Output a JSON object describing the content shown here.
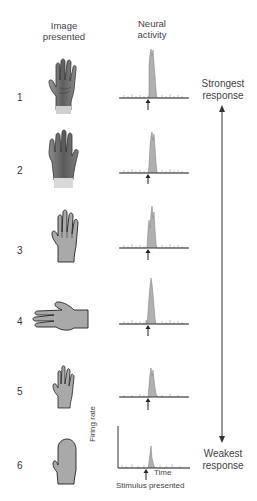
{
  "headers": {
    "image_presented": "Image\npresented",
    "image_line1": "Image",
    "image_line2": "presented",
    "neural_line1": "Neural",
    "neural_line2": "activity"
  },
  "rows": [
    {
      "number": "1",
      "image": "realistic-dark-hand-palm",
      "peak_height": 0.95
    },
    {
      "number": "2",
      "image": "realistic-dark-hand-back",
      "peak_height": 0.85
    },
    {
      "number": "3",
      "image": "outline-gray-hand-upright",
      "peak_height": 0.75
    },
    {
      "number": "4",
      "image": "outline-gray-hand-sideways",
      "peak_height": 0.85
    },
    {
      "number": "5",
      "image": "outline-gray-hand-small",
      "peak_height": 0.62
    },
    {
      "number": "6",
      "image": "mitten-shape",
      "peak_height": 0.4
    }
  ],
  "response_scale": {
    "top_line1": "Strongest",
    "top_line2": "response",
    "bottom_line1": "Weakest",
    "bottom_line2": "response"
  },
  "axis_labels": {
    "y": "Firing rate",
    "x": "Time",
    "stimulus": "Stimulus presented"
  },
  "colors": {
    "histogram_fill": "#b0b0b0",
    "axis": "#333333",
    "hand_realistic": "#6e6e6e",
    "hand_outline_fill": "#a9a9a9"
  }
}
